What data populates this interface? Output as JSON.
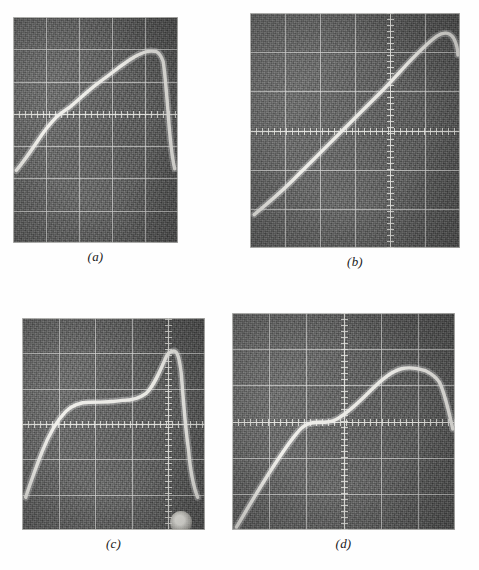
{
  "figure": {
    "kind": "oscilloscope-photograph-plate",
    "panel_count": 4,
    "layout": "2x2",
    "background_color": "#fefefe",
    "screen_color": "#5d5d5d",
    "graticule_color": "#dedede",
    "trace_color": "#f4f3ee"
  },
  "panels": [
    {
      "id": "a",
      "caption": "(a)",
      "frame": {
        "x": 13,
        "y": 17,
        "w": 165,
        "h": 226
      },
      "graticule": {
        "cols": 5,
        "rows": 7,
        "center_axis_h": true,
        "center_axis_v": false,
        "minor_tick_spacing": 6
      },
      "chart_data": {
        "type": "line",
        "title": "(a)",
        "xlabel": "",
        "ylabel": "",
        "xlim": [
          0,
          100
        ],
        "ylim": [
          0,
          100
        ],
        "grid": true,
        "legend": "none",
        "description": "Slow ramp rising from lower-left, gentle knee near one-quarter, near-linear rise to a rounded crest at ~85% of sweep, then abrupt near-vertical fall to baseline at the right edge.",
        "x": [
          2,
          7,
          13,
          20,
          26,
          32,
          40,
          48,
          56,
          64,
          72,
          78,
          83,
          87,
          90,
          92,
          94,
          96,
          98
        ],
        "y": [
          7,
          13,
          20,
          28,
          33,
          38,
          44,
          50,
          56,
          62,
          68,
          73,
          77,
          79,
          79,
          76,
          62,
          38,
          12
        ]
      }
    },
    {
      "id": "b",
      "caption": "(b)",
      "frame": {
        "x": 250,
        "y": 13,
        "w": 210,
        "h": 235
      },
      "graticule": {
        "cols": 6,
        "rows": 6,
        "center_axis_h": true,
        "center_axis_v": true,
        "minor_tick_spacing": 6
      },
      "chart_data": {
        "type": "line",
        "title": "(b)",
        "xlabel": "",
        "ylabel": "",
        "xlim": [
          0,
          100
        ],
        "ylim": [
          0,
          100
        ],
        "grid": true,
        "legend": "none",
        "description": "Smooth concave-up exponential-like rise from the bottom-left baseline, crossing the horizontal centre axis at about two thirds of the sweep, steepening to a rounded maximum just inside the right edge.",
        "x": [
          2,
          8,
          15,
          22,
          30,
          38,
          46,
          54,
          62,
          68,
          74,
          80,
          85,
          89,
          93,
          96,
          99
        ],
        "y": [
          4,
          9,
          15,
          21,
          27,
          33,
          40,
          46,
          52,
          58,
          64,
          71,
          78,
          85,
          91,
          93,
          89
        ]
      }
    },
    {
      "id": "c",
      "caption": "(c)",
      "frame": {
        "x": 22,
        "y": 318,
        "w": 183,
        "h": 212
      },
      "graticule": {
        "cols": 5,
        "rows": 6,
        "center_axis_h": true,
        "center_axis_v": true,
        "minor_tick_spacing": 6
      },
      "chart_data": {
        "type": "line",
        "title": "(c)",
        "xlabel": "",
        "ylabel": "",
        "xlim": [
          0,
          100
        ],
        "ylim": [
          0,
          100
        ],
        "grid": true,
        "legend": "none",
        "description": "Steep rise from the baseline, shoulder and flat plateau along the horizontal centre axis through the middle of the sweep, then a sharp narrow peak just left of the vertical centre axis followed by a near-vertical collapse to the baseline with a bright overshoot blob at the bottom.",
        "x": [
          2,
          6,
          10,
          15,
          20,
          26,
          31,
          36,
          42,
          50,
          58,
          64,
          70,
          75,
          79,
          82,
          85,
          87,
          90,
          93,
          96
        ],
        "y": [
          2,
          10,
          20,
          30,
          38,
          45,
          50,
          53,
          54,
          54,
          55,
          58,
          64,
          74,
          82,
          80,
          68,
          50,
          28,
          10,
          4
        ]
      }
    },
    {
      "id": "d",
      "caption": "(d)",
      "frame": {
        "x": 232,
        "y": 313,
        "w": 223,
        "h": 217
      },
      "graticule": {
        "cols": 6,
        "rows": 6,
        "center_axis_h": true,
        "center_axis_v": true,
        "minor_tick_spacing": 6
      },
      "chart_data": {
        "type": "line",
        "title": "(d)",
        "xlabel": "",
        "ylabel": "",
        "xlim": [
          0,
          100
        ],
        "ylim": [
          0,
          100
        ],
        "grid": true,
        "legend": "none",
        "description": "Rise from the lower-left baseline with a slight shoulder where it meets the horizontal centre axis, continuing up to a broad flat-topped maximum spanning the right half, then rolling off steeply at the extreme right edge.",
        "x": [
          2,
          7,
          13,
          19,
          25,
          31,
          37,
          43,
          50,
          57,
          63,
          70,
          76,
          82,
          88,
          92,
          95,
          97,
          99
        ],
        "y": [
          5,
          13,
          22,
          31,
          40,
          47,
          51,
          53,
          57,
          63,
          69,
          74,
          77,
          78,
          77,
          75,
          70,
          58,
          44
        ]
      }
    }
  ]
}
